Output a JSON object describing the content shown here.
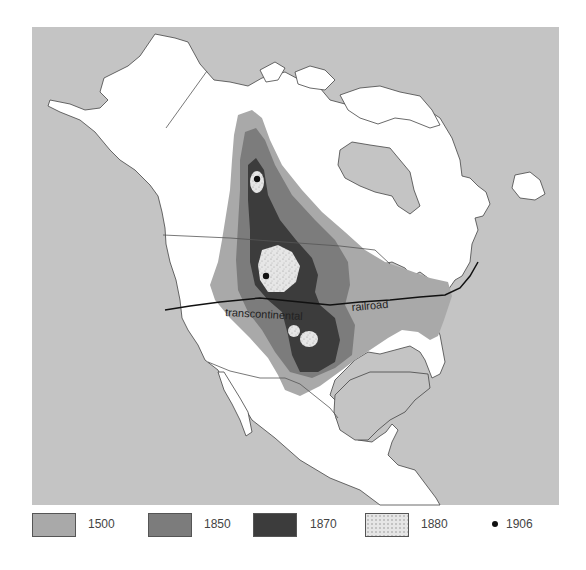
{
  "map": {
    "title": "",
    "region": "North America",
    "labels": {
      "railroad_part1": "transcontinental",
      "railroad_part2": "railroad"
    },
    "colors": {
      "ocean": "#c4c4c4",
      "land": "#ffffff",
      "coast": "#444444",
      "range_1500": "#a9a9a9",
      "range_1850": "#7c7c7c",
      "range_1870": "#3c3c3c",
      "range_1880": "#e4e4e4",
      "point_1906": "#111111"
    }
  },
  "legend": {
    "items": [
      {
        "label": "1500",
        "type": "swatch",
        "color": "#a9a9a9"
      },
      {
        "label": "1850",
        "type": "swatch",
        "color": "#7c7c7c"
      },
      {
        "label": "1870",
        "type": "swatch",
        "color": "#3c3c3c"
      },
      {
        "label": "1880",
        "type": "swatch-stippled",
        "color": "#e4e4e4"
      },
      {
        "label": "1906",
        "type": "dot",
        "color": "#111111"
      }
    ]
  }
}
